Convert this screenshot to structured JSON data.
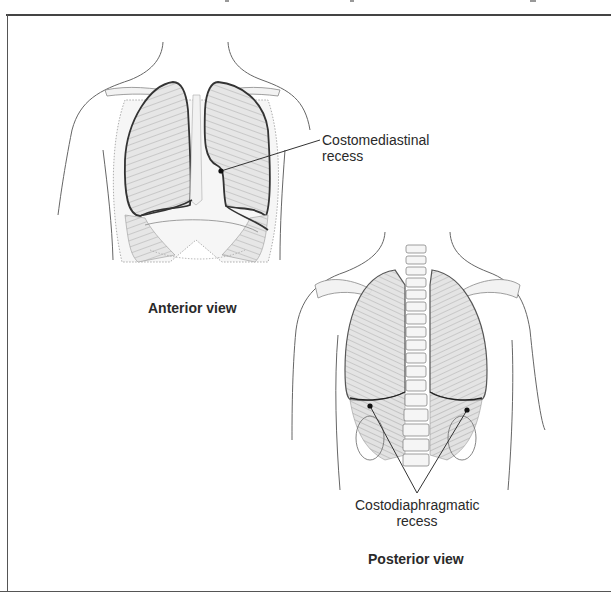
{
  "figure": {
    "panels": [
      {
        "id": "anterior",
        "title": "Anterior view",
        "callouts": [
          {
            "label_line1": "Costomediastinal",
            "label_line2": "recess"
          }
        ]
      },
      {
        "id": "posterior",
        "title": "Posterior view",
        "callouts": [
          {
            "label_line1": "Costodiaphragmatic",
            "label_line2": "recess"
          }
        ]
      }
    ]
  },
  "colors": {
    "outline": "#555555",
    "lung_fill": "#d9d9d9",
    "pleura_line": "#222222",
    "frame": "#444444"
  }
}
